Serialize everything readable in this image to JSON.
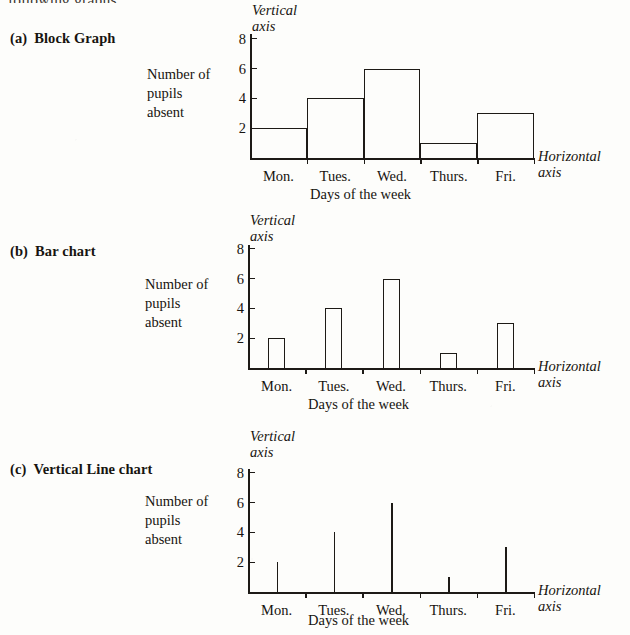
{
  "page": {
    "cutoff_text": "following graphs:"
  },
  "sections": [
    {
      "tag": "(a)",
      "title": "Block Graph"
    },
    {
      "tag": "(b)",
      "title": "Bar chart"
    },
    {
      "tag": "(c)",
      "title": "Vertical Line chart"
    }
  ],
  "labels": {
    "vertical_axis_line1": "Vertical",
    "vertical_axis_line2": "axis",
    "horizontal_axis_line1": "Horizontal",
    "horizontal_axis_line2": "axis",
    "y_desc_line1": "Number of",
    "y_desc_line2": "pupils",
    "y_desc_line3": "absent",
    "x_desc": "Days of the week"
  },
  "chart_data": [
    {
      "type": "bar",
      "title": "Block Graph",
      "variant": "block-graph",
      "categories": [
        "Mon.",
        "Tues.",
        "Wed.",
        "Thurs.",
        "Fri."
      ],
      "values": [
        2,
        4,
        6,
        1,
        3
      ],
      "xlabel": "Days of the week",
      "ylabel": "Number of pupils absent",
      "yticks": [
        2,
        4,
        6,
        8
      ],
      "ylim": [
        0,
        9
      ],
      "grid": false,
      "legend": "none"
    },
    {
      "type": "bar",
      "title": "Bar chart",
      "variant": "bar-chart",
      "categories": [
        "Mon.",
        "Tues.",
        "Wed.",
        "Thurs.",
        "Fri."
      ],
      "values": [
        2,
        4,
        6,
        1,
        3
      ],
      "xlabel": "Days of the week",
      "ylabel": "Number of pupils absent",
      "yticks": [
        2,
        4,
        6,
        8
      ],
      "ylim": [
        0,
        9
      ],
      "grid": false,
      "legend": "none"
    },
    {
      "type": "bar",
      "title": "Vertical Line chart",
      "variant": "vertical-line-chart",
      "categories": [
        "Mon.",
        "Tues.",
        "Wed.",
        "Thurs.",
        "Fri."
      ],
      "values": [
        2,
        4,
        6,
        1,
        3
      ],
      "xlabel": "Days of the week",
      "ylabel": "Number of pupils absent",
      "yticks": [
        2,
        4,
        6,
        8
      ],
      "ylim": [
        0,
        9
      ],
      "grid": false,
      "legend": "none"
    }
  ],
  "colors": {
    "ink": "#1d1a16",
    "paper": "#fdfdfb"
  }
}
